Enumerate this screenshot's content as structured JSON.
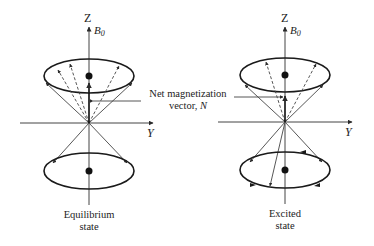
{
  "diagram": {
    "axis_labels": {
      "z": "Z",
      "y": "Y",
      "field": "B",
      "field_sub": "0"
    },
    "center_label": {
      "line1": "Net magnetization",
      "line2_prefix": "vector, ",
      "line2_symbol": "N"
    },
    "left": {
      "caption_line1": "Equilibrium",
      "caption_line2": "state"
    },
    "right": {
      "caption_line1": "Excited",
      "caption_line2": "state"
    },
    "colors": {
      "line": "#3a3a3a",
      "ellipse": "#1a1a1a",
      "text": "#222222",
      "background": "#ffffff"
    }
  }
}
